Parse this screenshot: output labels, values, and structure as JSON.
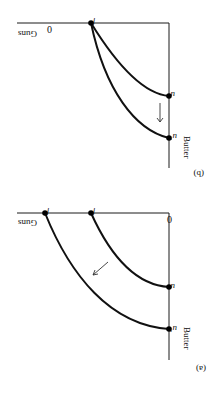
{
  "figure": {
    "orientation": "rotated-180",
    "panels": [
      {
        "id": "b",
        "label": "(b)",
        "x_axis_label": "Guns",
        "y_axis_label": "Butter",
        "origin_label": "0",
        "points": {
          "f": "f",
          "u": "u",
          "u_prime": "u′"
        },
        "arrow": "down"
      },
      {
        "id": "a",
        "label": "(a)",
        "x_axis_label": "Guns",
        "y_axis_label": "Butter",
        "origin_label": "0",
        "points": {
          "f": "f",
          "f_prime": "f′",
          "u": "u",
          "u_prime": "u′"
        },
        "arrow": "outward"
      }
    ],
    "colors": {
      "ink": "#111111",
      "background": "#ffffff"
    }
  }
}
